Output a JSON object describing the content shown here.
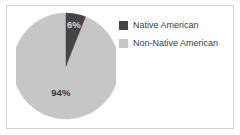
{
  "card": {
    "background": "#ffffff",
    "border_color": "#d2d2d2"
  },
  "chart_data": {
    "type": "pie",
    "title": "",
    "subtitle": "",
    "xlabel": "",
    "ylabel": "",
    "grid": false,
    "legend_position": "right",
    "start_angle_deg": 0,
    "direction": "clockwise",
    "categories": [
      "Native American",
      "Non-Native American"
    ],
    "values": [
      6,
      94
    ],
    "units": "percent",
    "colors": [
      "#454545",
      "#c6c6c6"
    ],
    "slices": [
      {
        "label": "Native American",
        "value": 6,
        "data_label": "6%",
        "color": "#454545",
        "label_color": "#d8d8d8"
      },
      {
        "label": "Non-Native American",
        "value": 94,
        "data_label": "94%",
        "color": "#c6c6c6",
        "label_color": "#3a3a3a"
      }
    ],
    "annotations": [
      "6%",
      "94%"
    ]
  },
  "legend": {
    "entries": [
      {
        "label": "Native American",
        "color": "#454545"
      },
      {
        "label": "Non-Native American",
        "color": "#c6c6c6"
      }
    ]
  }
}
